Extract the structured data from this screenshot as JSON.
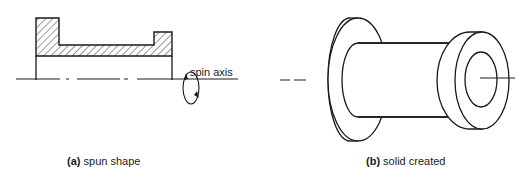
{
  "figure": {
    "panels": [
      {
        "id": "a",
        "label": "(a)",
        "caption": "spun shape",
        "annotation": "spin axis"
      },
      {
        "id": "b",
        "label": "(b)",
        "caption": "solid created"
      }
    ],
    "colors": {
      "stroke": "#1a1a1a",
      "background": "#ffffff"
    }
  }
}
